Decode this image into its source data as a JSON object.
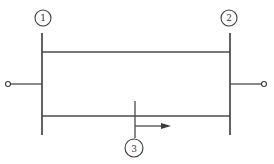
{
  "diagram": {
    "type": "one-line two-bus network with parallel lines",
    "colors": {
      "line": "#4a4a4a",
      "background": "#ffffff"
    },
    "buses": [
      {
        "id": "1",
        "label": "1",
        "x": 42,
        "y_top": 33,
        "y_bottom": 135
      },
      {
        "id": "2",
        "label": "2",
        "x": 230,
        "y_top": 33,
        "y_bottom": 135
      }
    ],
    "branches": [
      {
        "name": "upper-line",
        "from": "1",
        "to": "2",
        "y": 52
      },
      {
        "name": "lower-line",
        "from": "1",
        "to": "2",
        "y": 116
      }
    ],
    "terminals": [
      {
        "name": "left-terminal",
        "bus": "1",
        "y": 84
      },
      {
        "name": "right-terminal",
        "bus": "2",
        "y": 84
      }
    ],
    "fault_point": {
      "label": "3",
      "x": 135,
      "on_branch": "lower-line",
      "arrow_direction": "right"
    }
  }
}
